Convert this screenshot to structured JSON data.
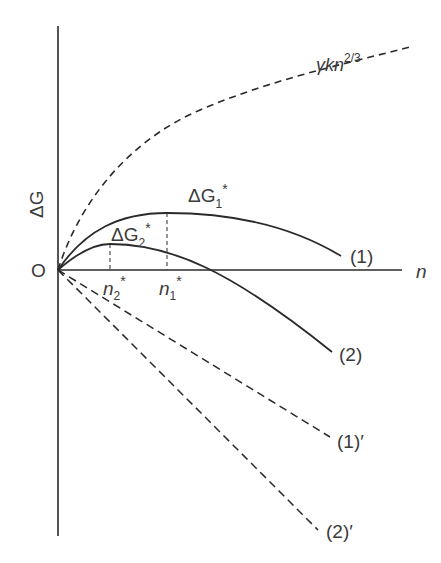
{
  "diagram": {
    "title": "",
    "axes": {
      "y_label": "ΔG",
      "x_label": "n",
      "origin_label": "O"
    },
    "curves": [
      {
        "id": "surface",
        "label_main": "γkn",
        "label_sup": "2/3",
        "style": "dashed"
      },
      {
        "id": "curve1",
        "label": "(1)",
        "style": "solid"
      },
      {
        "id": "curve2",
        "label": "(2)",
        "style": "solid"
      },
      {
        "id": "line1p",
        "label": "(1)′",
        "style": "dashed"
      },
      {
        "id": "line2p",
        "label": "(2)′",
        "style": "dashed"
      }
    ],
    "maxima": [
      {
        "id": "dG1",
        "label_main": "ΔG",
        "label_sub": "1",
        "label_sup": "*",
        "n_label_main": "n",
        "n_label_sub": "1",
        "n_label_sup": "*"
      },
      {
        "id": "dG2",
        "label_main": "ΔG",
        "label_sub": "2",
        "label_sup": "*",
        "n_label_main": "n",
        "n_label_sub": "2",
        "n_label_sup": "*"
      }
    ],
    "colors": {
      "line": "#2a2a2a",
      "text": "#3a3a3a",
      "background": "#ffffff"
    }
  }
}
